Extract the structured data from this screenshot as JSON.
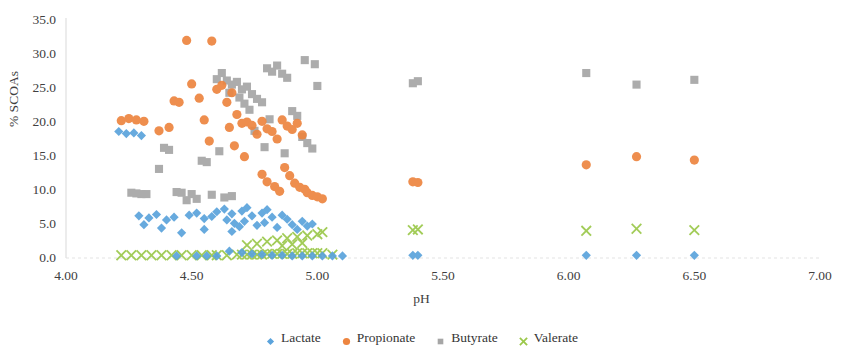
{
  "chart_data": {
    "type": "scatter",
    "title": "",
    "xlabel": "pH",
    "ylabel": "% SCOAs",
    "xlim": [
      4.0,
      7.0
    ],
    "ylim": [
      0.0,
      35.0
    ],
    "xticks": [
      "4.00",
      "4.50",
      "5.00",
      "5.50",
      "6.00",
      "6.50",
      "7.00"
    ],
    "xtick_values": [
      4.0,
      4.5,
      5.0,
      5.5,
      6.0,
      6.5,
      7.0
    ],
    "yticks": [
      "0.0",
      "5.0",
      "10.0",
      "15.0",
      "20.0",
      "25.0",
      "30.0",
      "35.0"
    ],
    "ytick_values": [
      0,
      5,
      10,
      15,
      20,
      25,
      30,
      35
    ],
    "grid": false,
    "legend_position": "bottom",
    "series": [
      {
        "name": "Lactate",
        "color": "#5BA3DC",
        "marker": "diamond",
        "points": [
          [
            4.21,
            18.6
          ],
          [
            4.24,
            18.3
          ],
          [
            4.27,
            18.4
          ],
          [
            4.3,
            18.0
          ],
          [
            4.29,
            6.2
          ],
          [
            4.33,
            5.9
          ],
          [
            4.36,
            6.4
          ],
          [
            4.31,
            4.9
          ],
          [
            4.4,
            5.6
          ],
          [
            4.43,
            6.0
          ],
          [
            4.38,
            4.4
          ],
          [
            4.46,
            3.7
          ],
          [
            4.49,
            6.3
          ],
          [
            4.52,
            6.6
          ],
          [
            4.55,
            5.8
          ],
          [
            4.58,
            6.1
          ],
          [
            4.55,
            4.2
          ],
          [
            4.6,
            6.8
          ],
          [
            4.63,
            7.2
          ],
          [
            4.66,
            6.5
          ],
          [
            4.64,
            5.6
          ],
          [
            4.67,
            5.1
          ],
          [
            4.69,
            4.6
          ],
          [
            4.7,
            6.9
          ],
          [
            4.72,
            7.4
          ],
          [
            4.74,
            6.2
          ],
          [
            4.71,
            5.4
          ],
          [
            4.76,
            4.8
          ],
          [
            4.66,
            3.9
          ],
          [
            4.78,
            6.6
          ],
          [
            4.8,
            7.1
          ],
          [
            4.82,
            6.0
          ],
          [
            4.79,
            5.2
          ],
          [
            4.84,
            4.5
          ],
          [
            4.86,
            6.3
          ],
          [
            4.88,
            5.7
          ],
          [
            4.9,
            4.9
          ],
          [
            4.92,
            4.2
          ],
          [
            4.94,
            5.4
          ],
          [
            4.96,
            4.7
          ],
          [
            4.98,
            5.0
          ],
          [
            4.65,
            1.0
          ],
          [
            4.7,
            0.8
          ],
          [
            4.74,
            0.6
          ],
          [
            4.78,
            0.5
          ],
          [
            4.82,
            0.4
          ],
          [
            4.86,
            0.4
          ],
          [
            4.9,
            0.3
          ],
          [
            4.94,
            0.3
          ],
          [
            4.98,
            0.3
          ],
          [
            5.02,
            0.3
          ],
          [
            5.38,
            0.4
          ],
          [
            5.4,
            0.4
          ],
          [
            6.07,
            0.4
          ],
          [
            6.27,
            0.4
          ],
          [
            6.5,
            0.4
          ],
          [
            4.52,
            0.3
          ],
          [
            4.56,
            0.3
          ],
          [
            4.6,
            0.3
          ],
          [
            4.44,
            0.3
          ],
          [
            5.06,
            0.3
          ],
          [
            5.1,
            0.3
          ]
        ]
      },
      {
        "name": "Propionate",
        "color": "#ED8540",
        "marker": "circle",
        "points": [
          [
            4.22,
            20.2
          ],
          [
            4.25,
            20.5
          ],
          [
            4.28,
            20.3
          ],
          [
            4.31,
            20.1
          ],
          [
            4.37,
            18.7
          ],
          [
            4.43,
            23.1
          ],
          [
            4.45,
            22.9
          ],
          [
            4.41,
            19.2
          ],
          [
            4.48,
            32.0
          ],
          [
            4.5,
            25.6
          ],
          [
            4.53,
            23.5
          ],
          [
            4.55,
            20.3
          ],
          [
            4.58,
            31.9
          ],
          [
            4.6,
            24.8
          ],
          [
            4.62,
            25.4
          ],
          [
            4.64,
            22.9
          ],
          [
            4.57,
            17.2
          ],
          [
            4.66,
            24.3
          ],
          [
            4.68,
            21.1
          ],
          [
            4.7,
            19.8
          ],
          [
            4.65,
            19.2
          ],
          [
            4.72,
            20.0
          ],
          [
            4.74,
            19.5
          ],
          [
            4.76,
            18.2
          ],
          [
            4.67,
            16.5
          ],
          [
            4.78,
            20.1
          ],
          [
            4.71,
            14.9
          ],
          [
            4.8,
            19.0
          ],
          [
            4.82,
            18.6
          ],
          [
            4.84,
            17.5
          ],
          [
            4.86,
            20.3
          ],
          [
            4.88,
            19.4
          ],
          [
            4.9,
            18.9
          ],
          [
            4.92,
            19.8
          ],
          [
            4.94,
            18.1
          ],
          [
            4.87,
            13.3
          ],
          [
            4.89,
            12.1
          ],
          [
            4.91,
            11.0
          ],
          [
            4.93,
            10.4
          ],
          [
            4.95,
            10.1
          ],
          [
            4.96,
            9.6
          ],
          [
            4.98,
            9.2
          ],
          [
            5.0,
            9.0
          ],
          [
            5.02,
            8.7
          ],
          [
            4.83,
            10.5
          ],
          [
            4.85,
            9.8
          ],
          [
            4.8,
            11.2
          ],
          [
            4.78,
            12.3
          ],
          [
            5.38,
            11.2
          ],
          [
            5.4,
            11.1
          ],
          [
            6.07,
            13.7
          ],
          [
            6.27,
            14.9
          ],
          [
            6.5,
            14.4
          ]
        ]
      },
      {
        "name": "Butyrate",
        "color": "#A6A6A6",
        "marker": "square",
        "points": [
          [
            4.26,
            9.6
          ],
          [
            4.28,
            9.5
          ],
          [
            4.3,
            9.4
          ],
          [
            4.32,
            9.4
          ],
          [
            4.39,
            16.2
          ],
          [
            4.41,
            15.9
          ],
          [
            4.37,
            13.1
          ],
          [
            4.44,
            9.7
          ],
          [
            4.46,
            9.6
          ],
          [
            4.5,
            9.4
          ],
          [
            4.48,
            8.5
          ],
          [
            4.54,
            14.3
          ],
          [
            4.56,
            14.1
          ],
          [
            4.6,
            26.3
          ],
          [
            4.62,
            27.2
          ],
          [
            4.64,
            26.1
          ],
          [
            4.66,
            25.5
          ],
          [
            4.68,
            25.9
          ],
          [
            4.65,
            24.3
          ],
          [
            4.7,
            24.8
          ],
          [
            4.72,
            25.2
          ],
          [
            4.69,
            23.6
          ],
          [
            4.74,
            24.1
          ],
          [
            4.76,
            23.4
          ],
          [
            4.71,
            22.7
          ],
          [
            4.78,
            22.9
          ],
          [
            4.73,
            21.8
          ],
          [
            4.8,
            27.9
          ],
          [
            4.82,
            27.4
          ],
          [
            4.84,
            28.3
          ],
          [
            4.86,
            27.1
          ],
          [
            4.88,
            26.5
          ],
          [
            4.81,
            20.4
          ],
          [
            4.9,
            21.6
          ],
          [
            4.92,
            20.9
          ],
          [
            4.94,
            17.8
          ],
          [
            4.96,
            16.9
          ],
          [
            4.98,
            16.1
          ],
          [
            4.87,
            15.4
          ],
          [
            4.79,
            16.3
          ],
          [
            4.75,
            18.7
          ],
          [
            4.61,
            15.7
          ],
          [
            4.58,
            9.3
          ],
          [
            4.63,
            8.9
          ],
          [
            4.66,
            9.1
          ],
          [
            4.95,
            29.1
          ],
          [
            4.99,
            28.5
          ],
          [
            5.0,
            25.3
          ],
          [
            5.38,
            25.7
          ],
          [
            5.4,
            26.0
          ],
          [
            6.07,
            27.2
          ],
          [
            6.27,
            25.5
          ],
          [
            6.5,
            26.2
          ],
          [
            4.52,
            8.7
          ]
        ]
      },
      {
        "name": "Valerate",
        "color": "#9BC84A",
        "marker": "cross",
        "points": [
          [
            4.22,
            0.4
          ],
          [
            4.26,
            0.4
          ],
          [
            4.3,
            0.4
          ],
          [
            4.34,
            0.4
          ],
          [
            4.42,
            0.4
          ],
          [
            4.46,
            0.4
          ],
          [
            4.5,
            0.4
          ],
          [
            4.54,
            0.4
          ],
          [
            4.6,
            0.4
          ],
          [
            4.64,
            0.4
          ],
          [
            4.68,
            0.5
          ],
          [
            4.7,
            0.5
          ],
          [
            4.72,
            0.5
          ],
          [
            4.74,
            0.5
          ],
          [
            4.76,
            0.5
          ],
          [
            4.78,
            0.5
          ],
          [
            4.8,
            0.6
          ],
          [
            4.82,
            0.6
          ],
          [
            4.84,
            0.6
          ],
          [
            4.86,
            0.6
          ],
          [
            4.88,
            0.6
          ],
          [
            4.9,
            0.6
          ],
          [
            4.92,
            0.7
          ],
          [
            4.94,
            0.7
          ],
          [
            4.96,
            0.7
          ],
          [
            4.98,
            0.7
          ],
          [
            5.0,
            0.7
          ],
          [
            5.02,
            0.7
          ],
          [
            4.8,
            2.4
          ],
          [
            4.84,
            2.6
          ],
          [
            4.88,
            2.9
          ],
          [
            4.92,
            3.1
          ],
          [
            4.96,
            3.3
          ],
          [
            5.0,
            3.5
          ],
          [
            4.76,
            2.1
          ],
          [
            4.72,
            1.9
          ],
          [
            5.02,
            3.8
          ],
          [
            4.94,
            2.2
          ],
          [
            4.9,
            2.0
          ],
          [
            4.86,
            1.8
          ],
          [
            5.38,
            4.1
          ],
          [
            5.4,
            4.2
          ],
          [
            6.07,
            4.0
          ],
          [
            6.27,
            4.3
          ],
          [
            6.5,
            4.1
          ],
          [
            4.38,
            0.4
          ],
          [
            4.58,
            0.4
          ],
          [
            5.06,
            0.5
          ]
        ]
      }
    ]
  },
  "legend": {
    "items": [
      {
        "label": "Lactate",
        "color": "#5BA3DC",
        "marker": "diamond"
      },
      {
        "label": "Propionate",
        "color": "#ED8540",
        "marker": "circle"
      },
      {
        "label": "Butyrate",
        "color": "#A6A6A6",
        "marker": "square"
      },
      {
        "label": "Valerate",
        "color": "#9BC84A",
        "marker": "cross"
      }
    ]
  }
}
